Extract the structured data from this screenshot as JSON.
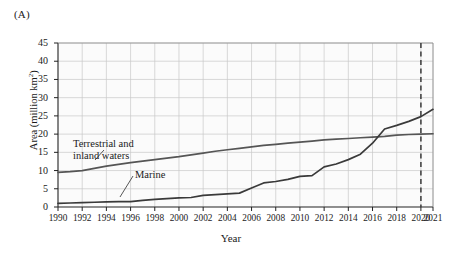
{
  "panel": {
    "label": "(A)"
  },
  "chart_data": {
    "type": "line",
    "title": "",
    "xlabel": "Year",
    "ylabel": "Area (million km²)",
    "xlim": [
      1990,
      2021
    ],
    "ylim": [
      0,
      45
    ],
    "ytick_step": 5,
    "yticks": [
      0,
      5,
      10,
      15,
      20,
      25,
      30,
      35,
      40,
      45
    ],
    "xticks": [
      1990,
      1992,
      1994,
      1996,
      1998,
      2000,
      2002,
      2004,
      2006,
      2008,
      2010,
      2012,
      2014,
      2016,
      2018,
      2020,
      2021
    ],
    "grid": true,
    "legend": "inline-annotations",
    "annotations": [
      {
        "name": "terrestrial-label",
        "text": "Terrestrial and\ninland waters",
        "line1": "Terrestrial and",
        "line2": "inland waters"
      },
      {
        "name": "marine-label",
        "text": "Marine"
      }
    ],
    "reference_lines": [
      {
        "name": "year-2020-marker",
        "x": 2020,
        "style": "dashed",
        "color": "#3a3a3a"
      }
    ],
    "x": [
      1990,
      1991,
      1992,
      1993,
      1994,
      1995,
      1996,
      1997,
      1998,
      1999,
      2000,
      2001,
      2002,
      2003,
      2004,
      2005,
      2006,
      2007,
      2008,
      2009,
      2010,
      2011,
      2012,
      2013,
      2014,
      2015,
      2016,
      2017,
      2018,
      2019,
      2020,
      2021
    ],
    "series": [
      {
        "name": "Terrestrial and inland waters",
        "color": "#555555",
        "values": [
          9.5,
          9.7,
          10.0,
          10.6,
          11.2,
          11.7,
          12.2,
          12.6,
          13.0,
          13.4,
          13.8,
          14.3,
          14.8,
          15.3,
          15.7,
          16.1,
          16.5,
          16.9,
          17.2,
          17.5,
          17.8,
          18.1,
          18.4,
          18.6,
          18.8,
          19.0,
          19.2,
          19.4,
          19.7,
          19.9,
          20.0,
          20.1
        ]
      },
      {
        "name": "Marine",
        "color": "#3a3a3a",
        "values": [
          1.0,
          1.1,
          1.2,
          1.3,
          1.4,
          1.5,
          1.5,
          1.8,
          2.1,
          2.3,
          2.5,
          2.6,
          3.2,
          3.4,
          3.6,
          3.8,
          5.2,
          6.6,
          7.0,
          7.6,
          8.4,
          8.6,
          11.0,
          11.8,
          13.0,
          14.5,
          17.5,
          21.4,
          22.4,
          23.5,
          24.8,
          26.8
        ]
      }
    ]
  }
}
